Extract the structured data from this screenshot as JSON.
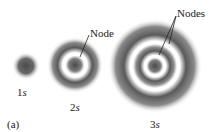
{
  "figure": {
    "panel_label": "(a)",
    "orbitals": [
      {
        "name": "1s",
        "num": "1",
        "letter": "s"
      },
      {
        "name": "2s",
        "num": "2",
        "letter": "s"
      },
      {
        "name": "3s",
        "num": "3",
        "letter": "s"
      }
    ],
    "annotations": {
      "node_2s": "Node",
      "nodes_3s": "Nodes"
    },
    "colors": {
      "density": "#555555",
      "background": "#ffffff"
    }
  }
}
